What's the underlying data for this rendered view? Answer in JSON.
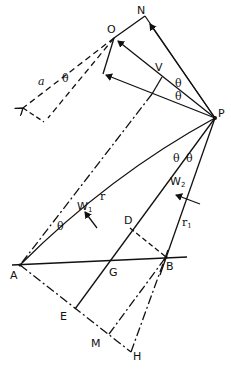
{
  "diagram": {
    "points": {
      "N": {
        "label": "N",
        "x": 145,
        "y": 16
      },
      "O": {
        "label": "O",
        "x": 114,
        "y": 38
      },
      "P": {
        "label": "P",
        "x": 215,
        "y": 118
      },
      "V": {
        "label": "V",
        "x": 162,
        "y": 77
      },
      "A": {
        "label": "A",
        "x": 20,
        "y": 265
      },
      "B": {
        "label": "B",
        "x": 166,
        "y": 257
      },
      "D": {
        "label": "D",
        "x": 130,
        "y": 228
      },
      "G": {
        "label": "G",
        "x": 100,
        "y": 262
      },
      "E": {
        "label": "E",
        "x": 75,
        "y": 309
      },
      "M": {
        "label": "M",
        "x": 109,
        "y": 334
      },
      "H": {
        "label": "H",
        "x": 131,
        "y": 352
      }
    },
    "labels": {
      "a": "a",
      "theta": "θ",
      "r": "r",
      "r1": "r",
      "r1_sub": "1",
      "W1": "W",
      "W1_sub": "1",
      "W2": "W",
      "W2_sub": "2"
    },
    "stroke_color": "#111111",
    "background": "#ffffff"
  }
}
